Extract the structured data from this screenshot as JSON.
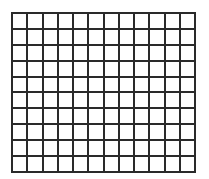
{
  "grid": {
    "columns": 12,
    "rows": 10,
    "line_color": "#2a2a2a",
    "fill_color": "#ffffff"
  }
}
